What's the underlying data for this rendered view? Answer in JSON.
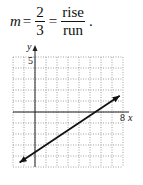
{
  "equation": {
    "variable": "m",
    "equals": "=",
    "fraction1": {
      "numerator": "2",
      "denominator": "3"
    },
    "equals2": "=",
    "fraction2": {
      "numerator": "rise",
      "denominator": "run"
    },
    "end": "."
  },
  "chart_data": {
    "type": "line",
    "title": "",
    "xlabel": "x",
    "ylabel": "y",
    "xlim": [
      -2,
      8
    ],
    "ylim": [
      -5,
      5
    ],
    "grid": true,
    "tick_labels": {
      "x": [
        "8"
      ],
      "y": [
        "5"
      ]
    },
    "series": [
      {
        "name": "line",
        "slope": 0.6667,
        "intercept": -3.667,
        "x": [
          -1.4,
          7.7
        ],
        "y": [
          -4.6,
          1.47
        ],
        "arrows": "both"
      }
    ]
  },
  "labels": {
    "x_axis": "x",
    "y_axis": "y",
    "x_tick": "8",
    "y_tick": "5"
  }
}
